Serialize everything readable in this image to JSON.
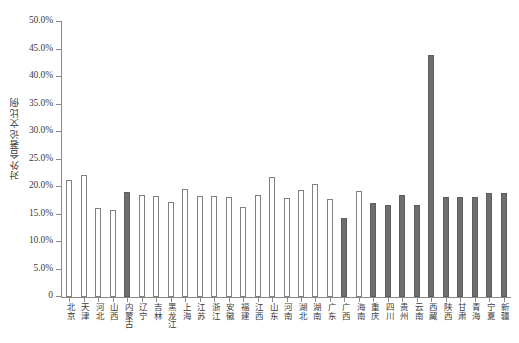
{
  "chart_data": {
    "type": "bar",
    "title": "",
    "xlabel": "",
    "ylabel": "对外合著论文比例",
    "ylim": [
      0,
      0.5
    ],
    "grid": false,
    "legend": null,
    "y_tick_labels": [
      "50.0%",
      "45.0%",
      "40.0%",
      "35.0%",
      "30.0%",
      "25.0%",
      "20.0%",
      "15.0%",
      "10.0%",
      "5.0%",
      "0"
    ],
    "y_tick_values": [
      0.5,
      0.45,
      0.4,
      0.35,
      0.3,
      0.25,
      0.2,
      0.15,
      0.1,
      0.05,
      0.0
    ],
    "categories": [
      "北京",
      "天津",
      "河北",
      "山西",
      "内蒙古",
      "辽宁",
      "吉林",
      "黑龙江",
      "上海",
      "江苏",
      "浙江",
      "安徽",
      "福建",
      "江西",
      "山东",
      "河南",
      "湖北",
      "湖南",
      "广东",
      "广西",
      "海南",
      "重庆",
      "四川",
      "贵州",
      "云南",
      "西藏",
      "陕西",
      "甘肃",
      "青海",
      "宁夏",
      "新疆"
    ],
    "values": [
      0.213,
      0.222,
      0.161,
      0.159,
      0.191,
      0.185,
      0.184,
      0.172,
      0.196,
      0.183,
      0.184,
      0.182,
      0.163,
      0.185,
      0.219,
      0.18,
      0.195,
      0.205,
      0.179,
      0.143,
      0.193,
      0.171,
      0.167,
      0.185,
      0.167,
      0.44,
      0.182,
      0.181,
      0.182,
      0.19,
      0.19
    ],
    "bar_styles": [
      "open",
      "open",
      "open",
      "open",
      "filled",
      "open",
      "open",
      "open",
      "open",
      "open",
      "open",
      "open",
      "open",
      "open",
      "open",
      "open",
      "open",
      "open",
      "open",
      "filled",
      "open",
      "filled",
      "filled",
      "filled",
      "filled",
      "filled",
      "filled",
      "filled",
      "filled",
      "filled",
      "filled"
    ],
    "colors": {
      "open_fill": "#ffffff",
      "open_stroke": "#808080",
      "filled_fill": "#6e6e6e",
      "filled_stroke": "#5e5e5e",
      "axis": "#8a8a8a",
      "text": "#3c3c3c",
      "background": "#ffffff"
    }
  }
}
